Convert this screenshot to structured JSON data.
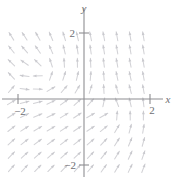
{
  "figure": {
    "name": "direction-field-plot",
    "background_color": "#ffffff",
    "arrow_color": "#d2d2d6",
    "axis_color": "#8e8e92",
    "label_color": "#6e6e73"
  },
  "axes": {
    "x_label": "x",
    "y_label": "y",
    "origin_px": {
      "x": 84,
      "y": 99
    },
    "pixels_per_unit": {
      "x": 33,
      "y": 33
    },
    "x_ticks": [
      {
        "value": -2,
        "label": "2",
        "display": "−2",
        "px": 18
      },
      {
        "value": 2,
        "label": "2",
        "display": "2",
        "px": 150
      }
    ],
    "y_ticks": [
      {
        "value": 2,
        "label": "2",
        "display": "2",
        "px": 33
      },
      {
        "value": -2,
        "label": "2",
        "display": "−2",
        "px": 165
      }
    ],
    "x_range": [
      -2.25,
      2.6
    ],
    "y_range": [
      -2.35,
      2.45
    ],
    "grid": false
  },
  "chart_data": {
    "type": "scatter",
    "title": "",
    "xlabel": "x",
    "ylabel": "y",
    "xlim": [
      -2.25,
      2.6
    ],
    "ylim": [
      -2.35,
      2.45
    ],
    "grid": false,
    "legend": null,
    "arrow_grid": {
      "x_start": -2.2,
      "x_step": 0.4,
      "x_count": 11,
      "y_start": -2.1,
      "y_step": 0.4,
      "y_count": 11,
      "arrow_length_px": 9
    },
    "critical_points": [
      {
        "x": -1.2,
        "y": 0.7,
        "kind": "spiral-source"
      },
      {
        "x": 0.9,
        "y": -0.5,
        "kind": "spiral-sink"
      }
    ],
    "vector_field": {
      "u_expr": "y + 0.55*(x + 1.2)",
      "v_expr": "-(x + 1.2) + 0.55*(y - 0.7)",
      "note": "approximate swirl field reconstructed from arrow orientations"
    }
  }
}
